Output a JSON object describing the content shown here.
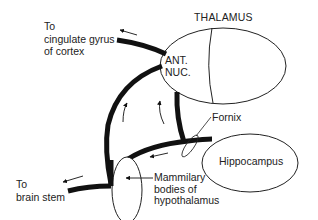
{
  "diagram": {
    "type": "neuroanatomy pathway (Papez circuit)",
    "nodes": {
      "thalamus": {
        "label": "THALAMUS"
      },
      "anterior_nucleus": {
        "line1": "ANT.",
        "line2": "NUC."
      },
      "hippocampus": {
        "label": "Hippocampus"
      },
      "mammillary": {
        "line1": "Mammilary",
        "line2": "bodies of",
        "line3": "hypothalamus"
      }
    },
    "labels": {
      "cingulate": {
        "line1": "To",
        "line2": "cingulate gyrus",
        "line3": "of cortex"
      },
      "brain_stem": {
        "line1": "To",
        "line2": "brain stem"
      },
      "fornix": {
        "label": "Fornix"
      }
    },
    "edges": [
      {
        "from": "hippocampus",
        "to": "mammillary",
        "via": "Fornix"
      },
      {
        "from": "mammillary",
        "to": "anterior_nucleus"
      },
      {
        "from": "fornix",
        "to": "anterior_nucleus"
      },
      {
        "from": "anterior_nucleus",
        "to": "cingulate gyrus of cortex"
      },
      {
        "from": "mammillary",
        "to": "brain stem"
      }
    ],
    "colors": {
      "stroke": "#111111",
      "background": "#ffffff"
    }
  }
}
